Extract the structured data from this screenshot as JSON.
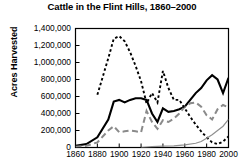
{
  "chart_data": {
    "type": "line",
    "title": "Cattle in the Flint Hills, 1860–2000",
    "xlabel": "",
    "ylabel": "Acres Harvested",
    "ylim": [
      0,
      1400000
    ],
    "xlim": [
      1860,
      2000
    ],
    "grid": false,
    "legend": "none",
    "y_ticks": [
      "1,400,000",
      "1,200,000",
      "1,000,000",
      "800,000",
      "600,000",
      "400,000",
      "200,000",
      "0"
    ],
    "y_tick_values": [
      1400000,
      1200000,
      1000000,
      800000,
      600000,
      400000,
      200000,
      0
    ],
    "x_ticks": [
      "1860",
      "1880",
      "1900",
      "1920",
      "1940",
      "1960",
      "1980",
      "2000"
    ],
    "x_tick_note": "x-axis tick labels are cut off at the bottom edge of the screenshot; only the tops of the digits are visible",
    "x": [
      1860,
      1880,
      1900,
      1920,
      1940,
      1960,
      1980,
      2000
    ],
    "series": [
      {
        "name": "series-solid-black",
        "style": "solid",
        "color": "#000000",
        "width": 2.1,
        "x": [
          1860,
          1870,
          1880,
          1890,
          1895,
          1900,
          1905,
          1910,
          1915,
          1920,
          1925,
          1930,
          1935,
          1940,
          1945,
          1950,
          1955,
          1960,
          1965,
          1970,
          1975,
          1980,
          1985,
          1990,
          1995,
          2000
        ],
        "values": [
          20000,
          40000,
          120000,
          330000,
          540000,
          560000,
          530000,
          560000,
          580000,
          580000,
          560000,
          400000,
          300000,
          460000,
          420000,
          430000,
          450000,
          480000,
          560000,
          640000,
          700000,
          790000,
          850000,
          800000,
          640000,
          820000
        ]
      },
      {
        "name": "series-long-dash-gray",
        "style": "long-dash",
        "color": "#8a8a8a",
        "width": 2.0,
        "x": [
          1860,
          1870,
          1880,
          1890,
          1895,
          1900,
          1905,
          1910,
          1915,
          1920,
          1925,
          1930,
          1935,
          1940,
          1945,
          1950,
          1955,
          1960,
          1965,
          1970,
          1975,
          1980,
          1985,
          1990,
          1995,
          2000
        ],
        "values": [
          10000,
          20000,
          60000,
          200000,
          250000,
          180000,
          190000,
          200000,
          190000,
          180000,
          430000,
          300000,
          220000,
          320000,
          300000,
          340000,
          400000,
          480000,
          520000,
          530000,
          480000,
          380000,
          330000,
          450000,
          500000,
          470000
        ]
      },
      {
        "name": "series-short-dash-black",
        "style": "short-dash",
        "color": "#000000",
        "width": 1.9,
        "x": [
          1860,
          1870,
          1880,
          1890,
          1895,
          1900,
          1905,
          1910,
          1915,
          1920,
          1925,
          1930,
          1935,
          1940,
          1945,
          1950,
          1955,
          1960,
          1965,
          1970,
          1975,
          1980,
          1985,
          1990,
          1995,
          2000
        ],
        "values": [
          null,
          null,
          620000,
          1050000,
          1280000,
          1310000,
          1250000,
          1120000,
          960000,
          780000,
          520000,
          640000,
          530000,
          900000,
          700000,
          560000,
          560000,
          460000,
          360000,
          270000,
          190000,
          120000,
          60000,
          40000,
          70000,
          130000
        ]
      },
      {
        "name": "series-thin-gray",
        "style": "solid",
        "color": "#909090",
        "width": 1.2,
        "x": [
          1920,
          1930,
          1940,
          1950,
          1960,
          1970,
          1975,
          1980,
          1985,
          1990,
          1995,
          2000
        ],
        "values": [
          0,
          10000,
          15000,
          20000,
          30000,
          50000,
          70000,
          110000,
          150000,
          200000,
          250000,
          330000
        ]
      }
    ]
  }
}
